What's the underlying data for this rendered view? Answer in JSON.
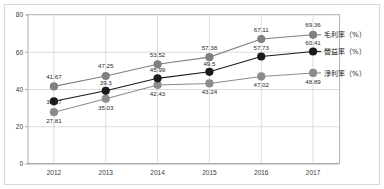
{
  "chart_data": {
    "type": "line",
    "title": "",
    "xlabel": "",
    "ylabel": "",
    "categories": [
      "2012",
      "2013",
      "2014",
      "2015",
      "2016",
      "2017"
    ],
    "ylim": [
      0,
      80
    ],
    "yticks": [
      0,
      20,
      40,
      60,
      80
    ],
    "grid": true,
    "legend_position": "right",
    "series": [
      {
        "name": "毛利率（%）",
        "color": "#808080",
        "values": [
          41.67,
          47.25,
          53.52,
          57.38,
          67.11,
          69.36
        ],
        "labels": [
          "41.67",
          "47.25",
          "53.52",
          "57.38",
          "67.11",
          "69.36"
        ]
      },
      {
        "name": "營益率（%）",
        "color": "#1a1a1a",
        "values": [
          33.67,
          39.3,
          45.99,
          49.5,
          57.73,
          60.41
        ],
        "labels": [
          "33.67",
          "39.3",
          "45.99",
          "49.5",
          "57.73",
          "60.41"
        ]
      },
      {
        "name": "淨利率（%）",
        "color": "#8c8c8c",
        "values": [
          27.81,
          35.03,
          42.43,
          43.24,
          47.02,
          48.89
        ],
        "labels": [
          "27.81",
          "35.03",
          "42.43",
          "43.24",
          "47.02",
          "48.89"
        ]
      }
    ]
  },
  "axis": {
    "y_ticks": [
      "0",
      "20",
      "40",
      "60",
      "80"
    ],
    "x_ticks": [
      "2012",
      "2013",
      "2014",
      "2015",
      "2016",
      "2017"
    ]
  },
  "legend": {
    "items": [
      {
        "label": "毛利率（%）",
        "color": "#808080"
      },
      {
        "label": "營益率（%）",
        "color": "#1a1a1a"
      },
      {
        "label": "淨利率（%）",
        "color": "#8c8c8c"
      }
    ]
  },
  "colors": {
    "gross_margin": "#808080",
    "operating_margin": "#1a1a1a",
    "net_margin": "#8c8c8c",
    "grid": "#cfcfcf",
    "axis": "#9a9a9a",
    "frame": "#d9d9d9",
    "text": "#2a2a2a"
  }
}
